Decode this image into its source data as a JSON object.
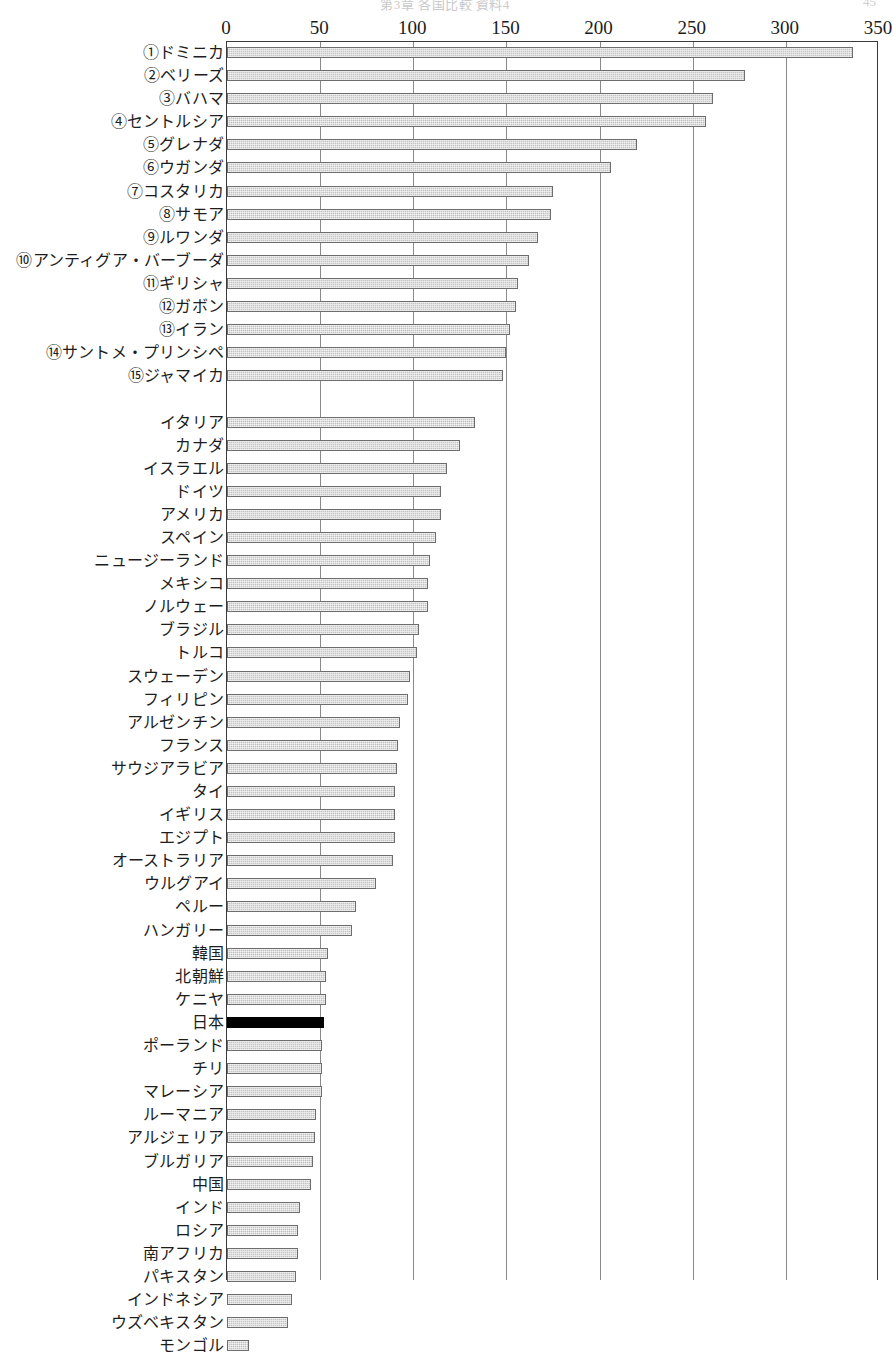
{
  "page_header": {
    "center_text": "第3章 各国比較 資料4",
    "page_number": "45"
  },
  "chart_data": {
    "type": "bar",
    "orientation": "horizontal",
    "title": "",
    "xlabel": "",
    "ylabel": "",
    "xlim": [
      0,
      350
    ],
    "xticks": [
      0,
      50,
      100,
      150,
      200,
      250,
      300,
      350
    ],
    "xtick_labels": [
      "0",
      "50",
      "100",
      "150",
      "200",
      "250",
      "300",
      "350"
    ],
    "grid": "vertical",
    "legend": "none",
    "highlight_category": "日本",
    "highlight_color": "#000000",
    "bar_color": "#c3c3c3",
    "bar_edge_color": "#6d6d6d",
    "groups": [
      {
        "name": "top15",
        "categories": [
          "①ドミニカ",
          "②ベリーズ",
          "③バハマ",
          "④セントルシア",
          "⑤グレナダ",
          "⑥ウガンダ",
          "⑦コスタリカ",
          "⑧サモア",
          "⑨ルワンダ",
          "⑩アンティグア・バーブーダ",
          "⑪ギリシャ",
          "⑫ガボン",
          "⑬イラン",
          "⑭サントメ・プリンシペ",
          "⑮ジャマイカ"
        ],
        "values": [
          336,
          278,
          261,
          257,
          220,
          206,
          175,
          174,
          167,
          162,
          156,
          155,
          152,
          150,
          148
        ]
      },
      {
        "name": "others",
        "categories": [
          "イタリア",
          "カナダ",
          "イスラエル",
          "ドイツ",
          "アメリカ",
          "スペイン",
          "ニュージーランド",
          "メキシコ",
          "ノルウェー",
          "ブラジル",
          "トルコ",
          "スウェーデン",
          "フィリピン",
          "アルゼンチン",
          "フランス",
          "サウジアラビア",
          "タイ",
          "イギリス",
          "エジプト",
          "オーストラリア",
          "ウルグアイ",
          "ペルー",
          "ハンガリー",
          "韓国",
          "北朝鮮",
          "ケニヤ",
          "日本",
          "ポーランド",
          "チリ",
          "マレーシア",
          "ルーマニア",
          "アルジェリア",
          "ブルガリア",
          "中国",
          "インド",
          "ロシア",
          "南アフリカ",
          "パキスタン",
          "インドネシア",
          "ウズベキスタン",
          "モンゴル"
        ],
        "values": [
          133,
          125,
          118,
          115,
          115,
          112,
          109,
          108,
          108,
          103,
          102,
          98,
          97,
          93,
          92,
          91,
          90,
          90,
          90,
          89,
          80,
          69,
          67,
          54,
          53,
          53,
          52,
          51,
          51,
          51,
          48,
          47,
          46,
          45,
          39,
          38,
          38,
          37,
          35,
          33,
          12
        ]
      }
    ]
  }
}
